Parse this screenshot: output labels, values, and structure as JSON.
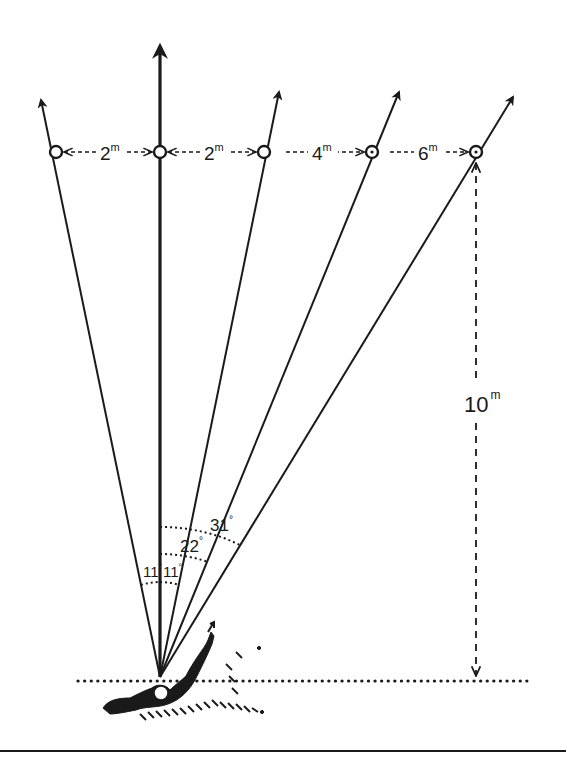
{
  "diagram": {
    "type": "geometric schematic",
    "colors": {
      "ink": "#1a1a1a",
      "background": "#ffffff"
    },
    "origin_point": {
      "x": 160,
      "y": 677
    },
    "baseline": {
      "y": 680,
      "style": "dotted"
    },
    "targets": [
      {
        "id": "t1",
        "x": 56,
        "y": 152,
        "marker": "open-circle"
      },
      {
        "id": "t2",
        "x": 160,
        "y": 152,
        "marker": "open-circle",
        "center": true
      },
      {
        "id": "t3",
        "x": 264,
        "y": 152,
        "marker": "open-circle"
      },
      {
        "id": "t4",
        "x": 372,
        "y": 152,
        "marker": "dotted-circle"
      },
      {
        "id": "t5",
        "x": 476,
        "y": 152,
        "marker": "dotted-circle"
      }
    ],
    "distances": [
      {
        "label": "2",
        "unit": "m"
      },
      {
        "label": "2",
        "unit": "m"
      },
      {
        "label": "4",
        "unit": "m"
      },
      {
        "label": "6",
        "unit": "m"
      }
    ],
    "depth": {
      "label": "10",
      "unit": "m"
    },
    "angles": [
      {
        "label": "11",
        "unit": "°",
        "side": "left"
      },
      {
        "label": "11",
        "unit": "°",
        "side": "right"
      },
      {
        "label": "22",
        "unit": "°"
      },
      {
        "label": "31",
        "unit": "°"
      }
    ]
  }
}
